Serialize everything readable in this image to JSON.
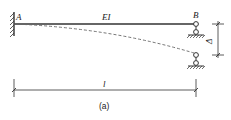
{
  "diagram": {
    "type": "structural-beam",
    "labels": {
      "left_end": "A",
      "right_end": "B",
      "stiffness": "EI",
      "span": "l",
      "settlement": "Δ",
      "caption": "(a)"
    },
    "supports": {
      "left": "fixed",
      "right": "roller (link) support",
      "right_displaced": "roller support after settlement Δ"
    },
    "deflected_shape": "dashed curve from A to displaced support B",
    "colors": {
      "line": "#333333",
      "dashed": "#666666",
      "background": "#ffffff"
    }
  }
}
